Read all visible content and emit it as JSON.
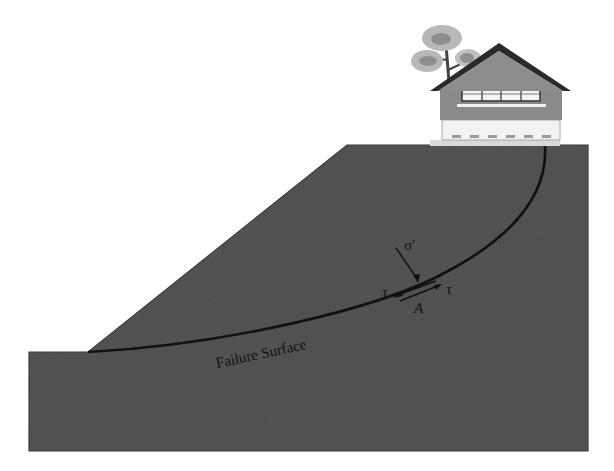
{
  "diagram": {
    "labels": {
      "failure_surface": "Failure Surface",
      "normal_stress": "σ′",
      "shear_left": "τ",
      "shear_right": "τ",
      "point": "A"
    },
    "colors": {
      "soil_light": "#f4f4f4",
      "soil_dark": "#555555",
      "outline": "#333333",
      "curve": "#111111",
      "roof": "#2a2a2a",
      "house_wall": "#8f8f8f",
      "tree": "#a8a8a8"
    },
    "elements": [
      "slope",
      "ground",
      "failure-surface",
      "house",
      "tree",
      "stress-element-A"
    ]
  }
}
